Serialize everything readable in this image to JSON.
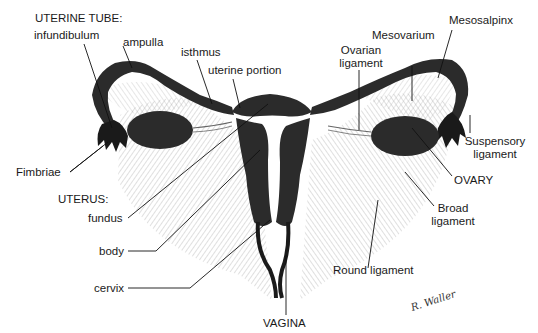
{
  "diagram": {
    "sections": {
      "uterine_tube_heading": "UTERINE TUBE:",
      "uterus_heading": "UTERUS:"
    },
    "labels": {
      "infundibulum": "infundibulum",
      "ampulla": "ampulla",
      "isthmus": "isthmus",
      "uterine_portion": "uterine portion",
      "fimbriae": "Fimbriae",
      "fundus": "fundus",
      "body": "body",
      "cervix": "cervix",
      "vagina": "VAGINA",
      "ovarian_ligament_line1": "Ovarian",
      "ovarian_ligament_line2": "ligament",
      "mesovarium": "Mesovarium",
      "mesosalpinx": "Mesosalpinx",
      "suspensory_line1": "Suspensory",
      "suspensory_line2": "ligament",
      "ovary": "OVARY",
      "broad_line1": "Broad",
      "broad_line2": "ligament",
      "round_ligament": "Round ligament"
    },
    "signature": "R. Waller",
    "colors": {
      "organ_fill": "#2b2b2b",
      "hatch": "#9a9a9a",
      "leader": "#111111",
      "background": "#ffffff"
    }
  }
}
